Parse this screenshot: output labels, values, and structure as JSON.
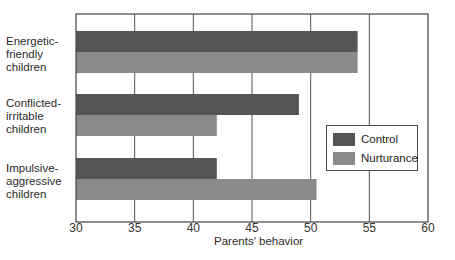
{
  "chart_data": {
    "type": "bar",
    "orientation": "horizontal",
    "title": "",
    "xlabel": "Parents' behavior",
    "ylabel": "",
    "xlim": [
      30,
      60
    ],
    "x_ticks": [
      30,
      35,
      40,
      45,
      50,
      55,
      60
    ],
    "grid": "vertical lines at ticks",
    "legend_position": "right-middle, inside plot",
    "categories": [
      "Energetic-friendly children",
      "Conflicted-irritable children",
      "Impulsive-aggressive children"
    ],
    "category_label_lines": [
      [
        "Energetic-",
        "friendly",
        "children"
      ],
      [
        "Conflicted-",
        "irritable",
        "children"
      ],
      [
        "Impulsive-",
        "aggressive",
        "children"
      ]
    ],
    "series": [
      {
        "name": "Control",
        "color": "#555555",
        "values": [
          54,
          49,
          42
        ]
      },
      {
        "name": "Nurturance",
        "color": "#8a8a8a",
        "values": [
          54,
          42,
          50.5
        ]
      }
    ]
  },
  "legend": {
    "items": [
      {
        "label": "Control",
        "color": "#555555"
      },
      {
        "label": "Nurturance",
        "color": "#8a8a8a"
      }
    ]
  }
}
